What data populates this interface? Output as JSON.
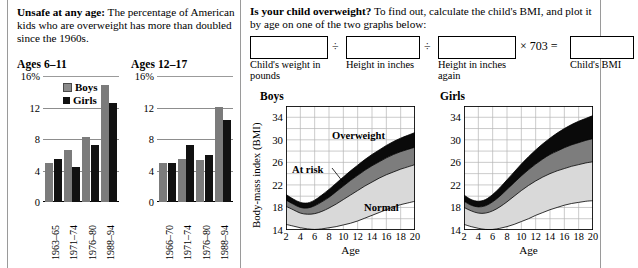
{
  "left": {
    "blurb_lead": "Unsafe at any age:",
    "blurb_rest": " The percentage of American kids who are overweight has more than doubled since the 1960s.",
    "legend": {
      "boys": "Boys",
      "girls": "Girls"
    }
  },
  "right": {
    "blurb_lead": "Is your child overweight?",
    "blurb_rest": " To find out, calculate the child's BMI, and plot it by age on one of the two graphs below:",
    "formula": {
      "op1": "÷",
      "op2": "÷",
      "op3": "× 703 =",
      "label1": "Child's weight in pounds",
      "label2": "Height in inches",
      "label3": "Height in inches again",
      "label4": "Child's BMI",
      "value1": "",
      "value2": "",
      "value3": "",
      "value4": ""
    }
  },
  "chart_data": [
    {
      "type": "bar",
      "title": "Ages 6–11",
      "categories": [
        "1963–65",
        "1971–74",
        "1976–80",
        "1988–94"
      ],
      "series": [
        {
          "name": "Boys",
          "values": [
            5.0,
            6.6,
            8.2,
            14.8
          ],
          "color": "#7b7b7b"
        },
        {
          "name": "Girls",
          "values": [
            5.4,
            4.4,
            7.2,
            12.6
          ],
          "color": "#111111"
        }
      ],
      "ylabel": "",
      "xlabel": "",
      "ylim": [
        0,
        16
      ],
      "yticks": [
        "16%",
        "12",
        "8",
        "4",
        "0"
      ],
      "ytick_values": [
        16,
        12,
        8,
        4,
        0
      ],
      "grid": true
    },
    {
      "type": "bar",
      "title": "Ages 12–17",
      "categories": [
        "1966–70",
        "1971–74",
        "1976–80",
        "1988–94"
      ],
      "series": [
        {
          "name": "Boys",
          "values": [
            5.0,
            5.4,
            5.3,
            12.1
          ],
          "color": "#7b7b7b"
        },
        {
          "name": "Girls",
          "values": [
            5.0,
            7.2,
            6.0,
            10.4
          ],
          "color": "#111111"
        }
      ],
      "ylabel": "",
      "xlabel": "",
      "ylim": [
        0,
        16
      ],
      "yticks": [
        "16%",
        "12",
        "8",
        "4",
        "0"
      ],
      "ytick_values": [
        16,
        12,
        8,
        4,
        0
      ],
      "grid": true
    },
    {
      "type": "area",
      "title": "Boys",
      "xlabel": "Age",
      "ylabel": "Body-mass index (BMI)",
      "xlim": [
        2,
        20
      ],
      "ylim": [
        14,
        36
      ],
      "xticks": [
        2,
        4,
        6,
        8,
        10,
        12,
        14,
        16,
        18,
        20
      ],
      "yticks": [
        14,
        18,
        22,
        26,
        30,
        34
      ],
      "grid": true,
      "band_labels": [
        "Overweight",
        "At risk",
        "Normal"
      ],
      "bands": [
        {
          "name": "Normal lower (5th pct)",
          "x": [
            2,
            3,
            4,
            5,
            6,
            7,
            8,
            9,
            10,
            11,
            12,
            13,
            14,
            15,
            16,
            17,
            18,
            19,
            20
          ],
          "y": [
            15.0,
            14.7,
            14.4,
            14.2,
            14.1,
            14.2,
            14.4,
            14.6,
            14.9,
            15.2,
            15.6,
            16.1,
            16.6,
            17.1,
            17.6,
            18.1,
            18.5,
            18.8,
            19.1
          ]
        },
        {
          "name": "Normal upper / At risk lower (85th pct)",
          "x": [
            2,
            3,
            4,
            5,
            6,
            7,
            8,
            9,
            10,
            11,
            12,
            13,
            14,
            15,
            16,
            17,
            18,
            19,
            20
          ],
          "y": [
            18.2,
            17.6,
            17.0,
            16.8,
            16.9,
            17.3,
            17.9,
            18.6,
            19.4,
            20.2,
            21.0,
            21.8,
            22.5,
            23.2,
            23.8,
            24.3,
            24.8,
            25.2,
            25.6
          ]
        },
        {
          "name": "At risk upper / Overweight lower (95th pct)",
          "x": [
            2,
            3,
            4,
            5,
            6,
            7,
            8,
            9,
            10,
            11,
            12,
            13,
            14,
            15,
            16,
            17,
            18,
            19,
            20
          ],
          "y": [
            19.3,
            18.6,
            18.0,
            17.9,
            18.3,
            19.0,
            19.8,
            20.8,
            21.8,
            22.8,
            23.7,
            24.6,
            25.4,
            26.1,
            26.8,
            27.4,
            27.9,
            28.3,
            28.7
          ]
        },
        {
          "name": "Overweight band top",
          "x": [
            2,
            3,
            4,
            5,
            6,
            7,
            8,
            9,
            10,
            11,
            12,
            13,
            14,
            15,
            16,
            17,
            18,
            19,
            20
          ],
          "y": [
            20.3,
            19.5,
            18.9,
            18.8,
            19.3,
            20.2,
            21.2,
            22.3,
            23.4,
            24.5,
            25.5,
            26.5,
            27.4,
            28.2,
            29.0,
            29.7,
            30.3,
            30.8,
            31.3
          ]
        }
      ]
    },
    {
      "type": "area",
      "title": "Girls",
      "xlabel": "Age",
      "ylabel": "",
      "xlim": [
        2,
        20
      ],
      "ylim": [
        14,
        36
      ],
      "xticks": [
        2,
        4,
        6,
        8,
        10,
        12,
        14,
        16,
        18,
        20
      ],
      "yticks": [
        14,
        18,
        22,
        26,
        30,
        34
      ],
      "grid": true,
      "band_labels": [],
      "bands": [
        {
          "name": "Normal lower (5th pct)",
          "x": [
            2,
            3,
            4,
            5,
            6,
            7,
            8,
            9,
            10,
            11,
            12,
            13,
            14,
            15,
            16,
            17,
            18,
            19,
            20
          ],
          "y": [
            15.0,
            14.6,
            14.3,
            14.1,
            14.1,
            14.3,
            14.6,
            15.0,
            15.5,
            16.0,
            16.6,
            17.1,
            17.6,
            18.0,
            18.4,
            18.7,
            18.9,
            19.1,
            19.2
          ]
        },
        {
          "name": "Normal upper / At risk lower (85th pct)",
          "x": [
            2,
            3,
            4,
            5,
            6,
            7,
            8,
            9,
            10,
            11,
            12,
            13,
            14,
            15,
            16,
            17,
            18,
            19,
            20
          ],
          "y": [
            18.0,
            17.4,
            17.0,
            17.0,
            17.4,
            18.1,
            19.0,
            20.0,
            21.0,
            21.9,
            22.7,
            23.4,
            24.0,
            24.5,
            24.9,
            25.3,
            25.6,
            25.9,
            26.1
          ]
        },
        {
          "name": "At risk upper / Overweight lower (95th pct)",
          "x": [
            2,
            3,
            4,
            5,
            6,
            7,
            8,
            9,
            10,
            11,
            12,
            13,
            14,
            15,
            16,
            17,
            18,
            19,
            20
          ],
          "y": [
            19.1,
            18.4,
            18.1,
            18.3,
            19.0,
            20.0,
            21.2,
            22.4,
            23.6,
            24.7,
            25.7,
            26.6,
            27.4,
            28.0,
            28.6,
            29.1,
            29.5,
            29.9,
            30.2
          ]
        },
        {
          "name": "Overweight band top",
          "x": [
            2,
            3,
            4,
            5,
            6,
            7,
            8,
            9,
            10,
            11,
            12,
            13,
            14,
            15,
            16,
            17,
            18,
            19,
            20
          ],
          "y": [
            20.2,
            19.4,
            19.1,
            19.4,
            20.3,
            21.5,
            22.9,
            24.3,
            25.7,
            27.0,
            28.2,
            29.3,
            30.3,
            31.2,
            32.0,
            32.7,
            33.3,
            33.8,
            34.3
          ]
        }
      ]
    }
  ]
}
